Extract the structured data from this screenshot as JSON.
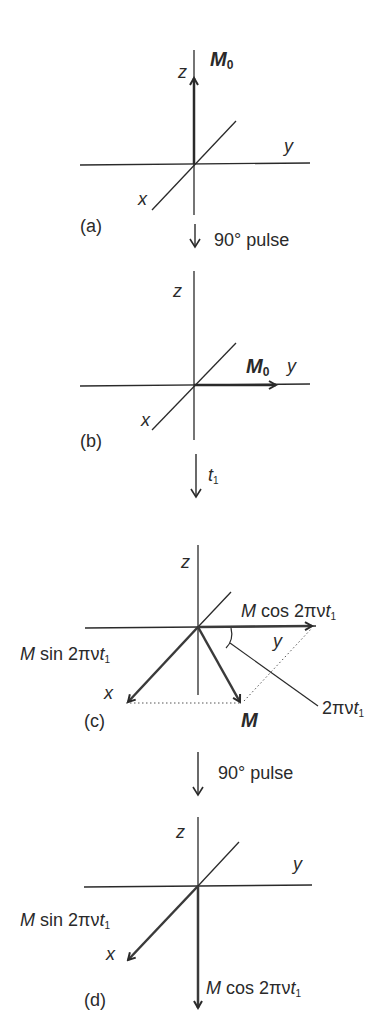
{
  "figure": {
    "panels": [
      {
        "id": "a",
        "label": "(a)",
        "axis_labels": {
          "z": "z",
          "y": "y",
          "x": "x"
        },
        "vector_label": "M",
        "vector_subscript": "0",
        "vector_direction": "+z"
      },
      {
        "id": "b",
        "label": "(b)",
        "axis_labels": {
          "z": "z",
          "y": "y",
          "x": "x"
        },
        "vector_label": "M",
        "vector_subscript": "0",
        "vector_direction": "+y"
      },
      {
        "id": "c",
        "label": "(c)",
        "axis_labels": {
          "z": "z",
          "y": "y",
          "x": "x"
        },
        "vector_label": "M",
        "component_y": {
          "prefix": "M",
          "func": " cos 2πν",
          "var": "t",
          "sub": "1"
        },
        "component_x": {
          "prefix": "M",
          "func": " sin 2πν",
          "var": "t",
          "sub": "1"
        },
        "angle": {
          "text": "2πν",
          "var": "t",
          "sub": "1"
        }
      },
      {
        "id": "d",
        "label": "(d)",
        "axis_labels": {
          "z": "z",
          "y": "y",
          "x": "x"
        },
        "component_x": {
          "prefix": "M",
          "func": " sin 2πν",
          "var": "t",
          "sub": "1"
        },
        "component_z": {
          "prefix": "M",
          "func": " cos 2πν",
          "var": "t",
          "sub": "1"
        }
      }
    ],
    "transitions": [
      {
        "from": "a",
        "to": "b",
        "text": "90° pulse"
      },
      {
        "from": "b",
        "to": "c",
        "text": "t",
        "sub": "1"
      },
      {
        "from": "c",
        "to": "d",
        "text": "90° pulse"
      }
    ],
    "colors": {
      "line": "#2a2a2a",
      "vector": "#3a3a3a",
      "background": "#ffffff"
    }
  }
}
